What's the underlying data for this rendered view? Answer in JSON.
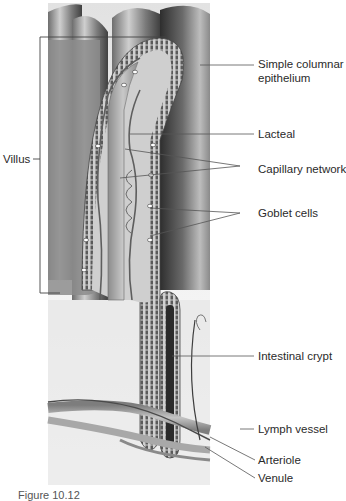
{
  "figure": {
    "caption": "Figure 10.12",
    "labels": {
      "villus": "Villus",
      "simple_columnar_1": "Simple columnar",
      "simple_columnar_2": "epithelium",
      "lacteal": "Lacteal",
      "capillary_network": "Capillary network",
      "goblet_cells": "Goblet cells",
      "intestinal_crypt": "Intestinal crypt",
      "lymph_vessel": "Lymph vessel",
      "arteriole": "Arteriole",
      "venule": "Venule"
    },
    "colors": {
      "background": "#ffffff",
      "leader_line": "#555555",
      "tissue_dark": "#3a3a3a",
      "tissue_mid": "#8a8a8a",
      "tissue_light": "#d8d8d8",
      "vessel": "#9a9a9a"
    }
  }
}
